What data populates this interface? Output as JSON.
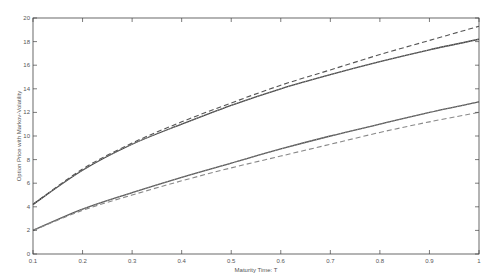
{
  "chart_data": {
    "type": "line",
    "title": "",
    "xlabel": "Maturity Time: T",
    "ylabel": "Option Price with Markov-Volatility",
    "xlim": [
      0.1,
      1.0
    ],
    "ylim": [
      0,
      20
    ],
    "grid": false,
    "legend": null,
    "x": [
      0.1,
      0.2,
      0.3,
      0.4,
      0.5,
      0.6,
      0.7,
      0.8,
      0.9,
      1.0
    ],
    "xticks": [
      "0.1",
      "0.2",
      "0.3",
      "0.4",
      "0.5",
      "0.6",
      "0.7",
      "0.8",
      "0.9",
      "1"
    ],
    "yticks": [
      "0",
      "2",
      "4",
      "6",
      "8",
      "10",
      "12",
      "14",
      "16",
      "18",
      "20"
    ],
    "series": [
      {
        "name": "upper-dashed",
        "style": "dashed",
        "color": "#555555",
        "values": [
          4.2,
          7.2,
          9.4,
          11.2,
          12.8,
          14.3,
          15.6,
          16.9,
          18.1,
          19.3
        ]
      },
      {
        "name": "upper-solid",
        "style": "solid",
        "color": "#444444",
        "values": [
          4.2,
          7.1,
          9.3,
          11.0,
          12.6,
          14.0,
          15.2,
          16.3,
          17.3,
          18.2
        ]
      },
      {
        "name": "upper-dotted",
        "style": "dotted",
        "color": "#999999",
        "values": [
          4.2,
          7.1,
          9.3,
          11.0,
          12.6,
          14.0,
          15.2,
          16.3,
          17.3,
          18.2
        ]
      },
      {
        "name": "lower-solid",
        "style": "solid",
        "color": "#555555",
        "values": [
          2.0,
          3.8,
          5.2,
          6.5,
          7.7,
          8.9,
          10.0,
          11.0,
          12.0,
          12.9
        ]
      },
      {
        "name": "lower-dotted",
        "style": "dotted",
        "color": "#999999",
        "values": [
          2.0,
          3.8,
          5.2,
          6.5,
          7.7,
          8.9,
          10.0,
          11.0,
          12.0,
          12.9
        ]
      },
      {
        "name": "lower-dashed",
        "style": "dashed",
        "color": "#888888",
        "values": [
          2.0,
          3.7,
          5.0,
          6.2,
          7.3,
          8.3,
          9.3,
          10.3,
          11.2,
          12.0
        ]
      }
    ]
  }
}
